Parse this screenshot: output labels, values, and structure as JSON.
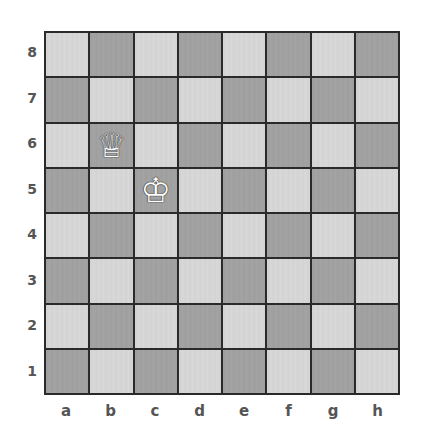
{
  "board": {
    "files": [
      "a",
      "b",
      "c",
      "d",
      "e",
      "f",
      "g",
      "h"
    ],
    "ranks": [
      "8",
      "7",
      "6",
      "5",
      "4",
      "3",
      "2",
      "1"
    ],
    "light_color": "#d4d4d4",
    "dark_color": "#a0a0a0",
    "pieces": [
      {
        "square": "b6",
        "type": "queen",
        "color": "white",
        "glyph": "♕"
      },
      {
        "square": "c5",
        "type": "king",
        "color": "white",
        "glyph": "♔"
      }
    ]
  }
}
